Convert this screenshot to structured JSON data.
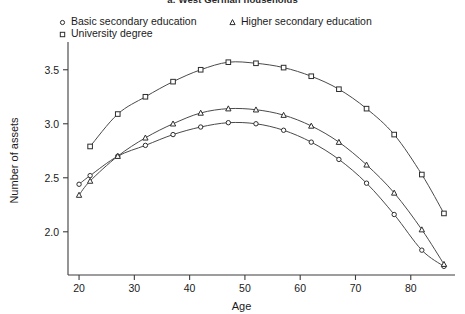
{
  "caption": "a: West German households",
  "legend": {
    "entries": [
      {
        "label": "Basic secondary education",
        "marker": "circle-marker"
      },
      {
        "label": "University degree",
        "marker": "square-marker"
      },
      {
        "label": "Higher secondary education",
        "marker": "triangle-marker"
      }
    ]
  },
  "axes": {
    "x_title": "Age",
    "y_title": "Number of assets",
    "x_ticks": [
      "20",
      "30",
      "40",
      "50",
      "60",
      "70",
      "80"
    ],
    "y_ticks": [
      "2.0",
      "2.5",
      "3.0",
      "3.5"
    ]
  },
  "chart_data": {
    "type": "line",
    "title": "a: West German households",
    "xlabel": "Age",
    "ylabel": "Number of assets",
    "xlim": [
      18,
      88
    ],
    "ylim": [
      1.6,
      3.72
    ],
    "grid": false,
    "legend_position": "top",
    "x_ticks": [
      20,
      30,
      40,
      50,
      60,
      70,
      80
    ],
    "y_ticks": [
      2.0,
      2.5,
      3.0,
      3.5
    ],
    "series": [
      {
        "name": "Basic secondary education",
        "marker": "open-circle",
        "x": [
          20,
          22,
          27,
          32,
          37,
          42,
          47,
          52,
          57,
          62,
          67,
          72,
          77,
          82,
          86
        ],
        "y": [
          2.44,
          2.52,
          2.7,
          2.8,
          2.9,
          2.97,
          3.01,
          3.0,
          2.94,
          2.83,
          2.67,
          2.45,
          2.16,
          1.83,
          1.68
        ]
      },
      {
        "name": "Higher secondary education",
        "marker": "open-triangle",
        "x": [
          20,
          22,
          27,
          32,
          37,
          42,
          47,
          52,
          57,
          62,
          67,
          72,
          77,
          82,
          86
        ],
        "y": [
          2.34,
          2.47,
          2.7,
          2.87,
          3.0,
          3.1,
          3.14,
          3.13,
          3.08,
          2.98,
          2.83,
          2.62,
          2.36,
          2.02,
          1.7
        ]
      },
      {
        "name": "University degree",
        "marker": "open-square",
        "x": [
          22,
          27,
          32,
          37,
          42,
          47,
          52,
          57,
          62,
          67,
          72,
          77,
          82,
          86
        ],
        "y": [
          2.79,
          3.09,
          3.25,
          3.39,
          3.5,
          3.57,
          3.56,
          3.52,
          3.44,
          3.32,
          3.14,
          2.9,
          2.53,
          2.17
        ]
      }
    ]
  }
}
